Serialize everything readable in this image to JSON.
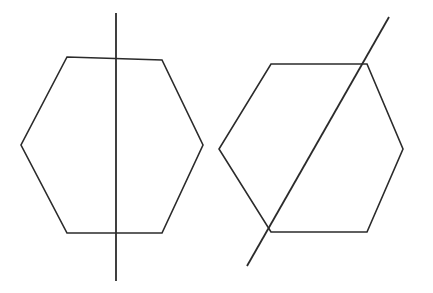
{
  "figure": {
    "background_color": "#ffffff",
    "stroke_color": "#2b2b2b",
    "canvas": {
      "width": 433,
      "height": 293
    },
    "shapes": [
      {
        "id": "left-hexagon",
        "label": "Hexagon with vertical line of symmetry",
        "type": "hexagon",
        "points": "67,57 162,60 203,145 162,233 67,233 21,145",
        "line": {
          "id": "left-symmetry-line",
          "label": "Vertical symmetry line",
          "orientation": "vertical",
          "x1": 116,
          "y1": 13,
          "x2": 116,
          "y2": 281
        }
      },
      {
        "id": "right-hexagon",
        "label": "Hexagon with diagonal line of symmetry",
        "type": "hexagon",
        "points": "271,64 367,64 403,149 367,232 271,232 219,149",
        "line": {
          "id": "right-symmetry-line",
          "label": "Diagonal symmetry line",
          "orientation": "diagonal",
          "x1": 389,
          "y1": 17,
          "x2": 247,
          "y2": 266
        }
      }
    ]
  }
}
